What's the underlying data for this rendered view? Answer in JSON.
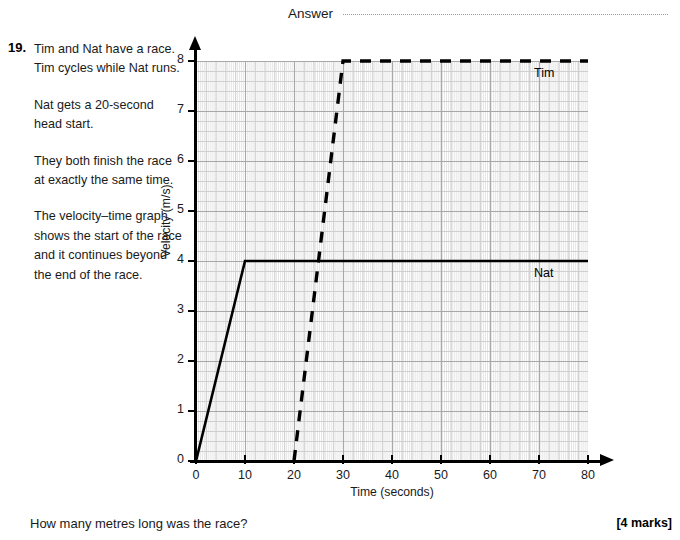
{
  "answer": {
    "label": "Answer"
  },
  "question": {
    "number": "19.",
    "paragraphs": [
      "Tim and Nat have a race. Tim cycles while Nat runs.",
      "Nat gets a 20-second head start.",
      "They both finish the race at exactly the same time.",
      "The velocity–time graph shows the start of the race and it continues beyond the end of the race."
    ],
    "prompt": "How many metres long was the race?",
    "marks": "[4 marks]"
  },
  "chart_data": {
    "type": "line",
    "title": "",
    "xlabel": "Time (seconds)",
    "ylabel": "Velocity (m/s)",
    "xlim": [
      0,
      80
    ],
    "ylim": [
      0,
      8
    ],
    "xticks": [
      0,
      10,
      20,
      30,
      40,
      50,
      60,
      70,
      80
    ],
    "yticks": [
      0,
      1,
      2,
      3,
      4,
      5,
      6,
      7,
      8
    ],
    "grid": true,
    "grid_minor": true,
    "legend": "inline-labels",
    "series": [
      {
        "name": "Nat",
        "style": "solid",
        "color": "#000000",
        "x": [
          0,
          10,
          80
        ],
        "y": [
          0,
          4,
          4
        ]
      },
      {
        "name": "Tim",
        "style": "dashed",
        "color": "#000000",
        "x": [
          20,
          30,
          80
        ],
        "y": [
          0,
          8,
          8
        ]
      }
    ],
    "annotations": [
      {
        "text": "Tim",
        "x": 62,
        "y": 7.7
      },
      {
        "text": "Nat",
        "x": 62,
        "y": 3.7
      }
    ]
  }
}
